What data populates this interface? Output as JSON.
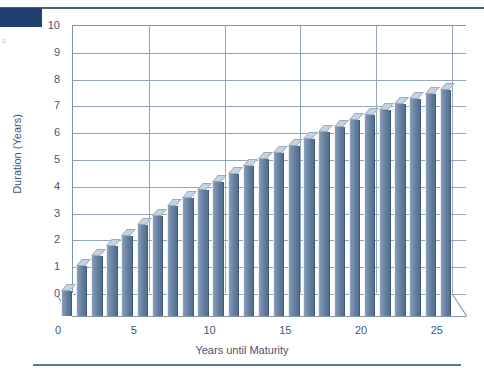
{
  "page": {
    "corner_mark": "s"
  },
  "chart_data": {
    "type": "bar",
    "title": "",
    "xlabel": "Years until Maturity",
    "ylabel": "Duration (Years)",
    "xlim": [
      0,
      26
    ],
    "ylim": [
      0,
      10
    ],
    "xticks": [
      0,
      5,
      10,
      15,
      20,
      25
    ],
    "yticks": [
      0,
      1,
      2,
      3,
      4,
      5,
      6,
      7,
      8,
      9,
      10
    ],
    "grid": true,
    "legend": false,
    "style": "3d-bar",
    "bar_color": "#6d87a6",
    "bar_top_color": "#c8d2de",
    "grid_color": "#93a6bc",
    "categories": [
      1,
      2,
      3,
      4,
      5,
      6,
      7,
      8,
      9,
      10,
      11,
      12,
      13,
      14,
      15,
      16,
      17,
      18,
      19,
      20,
      21,
      22,
      23,
      24,
      25,
      26
    ],
    "values": [
      0.95,
      1.85,
      2.25,
      2.6,
      3.0,
      3.4,
      3.75,
      4.1,
      4.4,
      4.7,
      5.0,
      5.3,
      5.6,
      5.85,
      6.1,
      6.35,
      6.6,
      6.85,
      7.05,
      7.3,
      7.5,
      7.7,
      7.9,
      8.1,
      8.3,
      8.45
    ]
  }
}
